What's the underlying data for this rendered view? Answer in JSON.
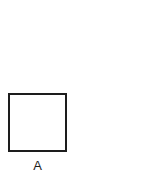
{
  "figure": {
    "background_color": "#ffffff",
    "stroke_color": "#1d1d1d",
    "fill_color": "#ffffff",
    "caption_text": "A",
    "shape": {
      "kind": "square",
      "name": "square-outline",
      "x": 8,
      "y": 93,
      "width": 59,
      "height": 59,
      "stroke_width": 2,
      "filled": false
    },
    "label": {
      "text": "A",
      "x": 40,
      "y": 168,
      "font_size": 13,
      "color": "#1d1d1d"
    }
  }
}
